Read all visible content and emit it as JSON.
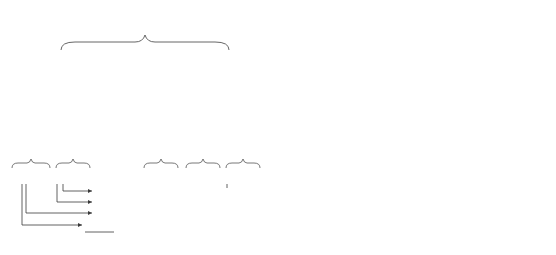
{
  "left_diagram": {
    "title": "3-digit BCD",
    "groups": [
      {
        "label": "MSD",
        "bits": [
          "l",
          "k",
          "j",
          "i"
        ],
        "weights": [
          "2³ × 100",
          "2² × 100",
          "2¹ × 100",
          "2⁰ × 100"
        ]
      },
      {
        "label": "Second digit",
        "bits": [
          "h",
          "g",
          "f",
          "e"
        ],
        "weights": [
          "2³ × 10",
          "2² × 10",
          "2¹ × 10",
          "2⁰ × 10"
        ]
      },
      {
        "label": "LSD",
        "bits": [
          "d",
          "c",
          "b",
          "a"
        ],
        "weights": [
          "2³ × 1",
          "2² × 1",
          "2¹ × 1",
          "2⁰ × 1"
        ]
      }
    ]
  },
  "example1": {
    "decimal_digits": [
      "6",
      "3"
    ],
    "decimal_label": "(decimal)",
    "bcd_groups": [
      "0110",
      "0011"
    ],
    "bcd_label": "(BCD)",
    "partials": [
      "0001",
      "0010",
      "10100",
      "101000"
    ],
    "plus": "+",
    "sum": "111111",
    "sum_label": "(binary)"
  },
  "example2": {
    "decimal_digits": [
      "8",
      "2",
      "3"
    ],
    "bcd_groups": [
      "1000",
      "0010",
      "0011"
    ],
    "partials": [
      "0001",
      "0010",
      "10100",
      "1100100000"
    ],
    "plus": "+",
    "sum": "1100110111"
  },
  "table": {
    "group_header": "Weighting factor",
    "columns": [
      "bit position",
      "decimal",
      "binary"
    ],
    "rows": [
      {
        "pos": "a",
        "dec": "1",
        "bin": "1"
      },
      {
        "pos": "b",
        "dec": "2",
        "bin": "10"
      },
      {
        "pos": "c",
        "dec": "4",
        "bin": "100"
      },
      {
        "pos": "d",
        "dec": "8",
        "bin": "1000"
      },
      {
        "pos": "e",
        "dec": "10",
        "bin": "1010"
      },
      {
        "pos": "f",
        "dec": "20",
        "bin": "10100"
      },
      {
        "pos": "g",
        "dec": "40",
        "bin": "101000"
      },
      {
        "pos": "h",
        "dec": "80",
        "bin": "1010000"
      },
      {
        "pos": "i",
        "dec": "100",
        "bin": "1100100"
      },
      {
        "pos": "j",
        "dec": "200",
        "bin": "11001000"
      },
      {
        "pos": "k",
        "dec": "400",
        "bin": "110010000"
      },
      {
        "pos": "l",
        "dec": "800",
        "bin": "1100100000"
      }
    ]
  }
}
